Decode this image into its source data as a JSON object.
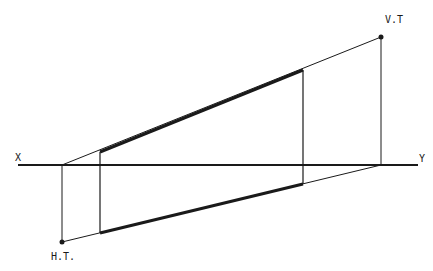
{
  "diagram": {
    "type": "orthographic-projection",
    "labels": {
      "x": "X",
      "y": "Y",
      "vt": "V.T",
      "ht": "H.T."
    },
    "colors": {
      "ink": "#1a1a1a",
      "background": "#ffffff"
    },
    "reference_line": {
      "from": [
        18,
        165
      ],
      "to": [
        418,
        165
      ]
    },
    "points": {
      "vt": [
        381,
        37
      ],
      "ht": [
        62,
        242
      ]
    },
    "elevation_line": {
      "from": [
        62,
        165
      ],
      "to": [
        381,
        37
      ],
      "thick_from": [
        100,
        152
      ],
      "thick_to": [
        303,
        70
      ]
    },
    "plan_line": {
      "from": [
        62,
        242
      ],
      "to": [
        381,
        165
      ],
      "thick_from": [
        100,
        233
      ],
      "thick_to": [
        303,
        184
      ]
    },
    "projectors": [
      {
        "name": "ht-projector",
        "from": [
          62,
          165
        ],
        "to": [
          62,
          242
        ]
      },
      {
        "name": "end-a-projector",
        "from": [
          100,
          152
        ],
        "to": [
          100,
          233
        ]
      },
      {
        "name": "end-b-projector",
        "from": [
          303,
          70
        ],
        "to": [
          303,
          184
        ]
      },
      {
        "name": "vt-projector",
        "from": [
          381,
          37
        ],
        "to": [
          381,
          165
        ]
      }
    ]
  }
}
